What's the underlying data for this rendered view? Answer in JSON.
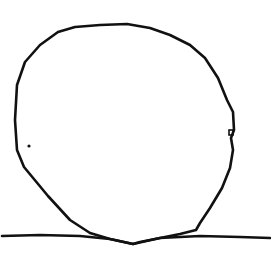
{
  "drawing": {
    "subject": "hand-drawn circle resting on a horizontal ground line",
    "elements": [
      "circle",
      "ground-line",
      "dot",
      "small-mark"
    ],
    "ink_color": "#111111",
    "background_color": "#ffffff"
  }
}
